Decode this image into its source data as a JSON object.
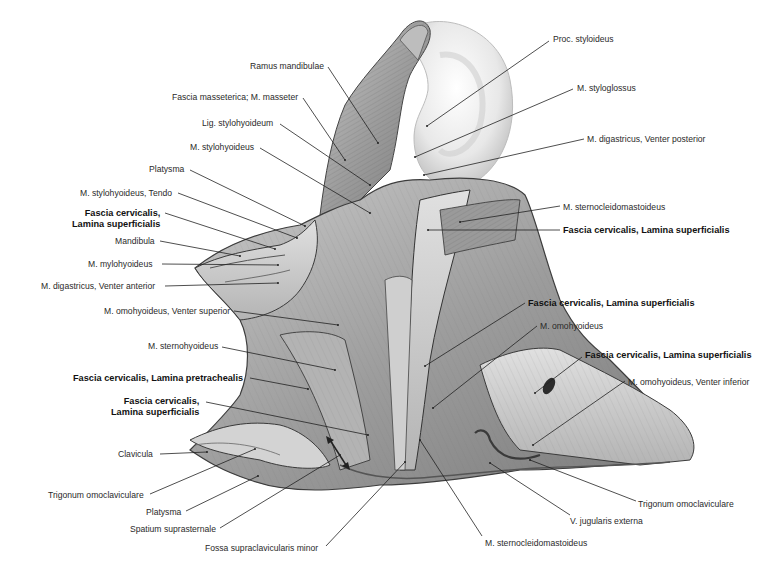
{
  "figure": {
    "colors": {
      "background": "#ffffff",
      "tissue_light": "#d8d8d8",
      "tissue_mid": "#a9a9a9",
      "tissue_dark": "#6e6e6e",
      "ear": "#ececec",
      "line": "#222222",
      "text": "#2a2a2a"
    }
  },
  "labels": [
    {
      "id": "ramus-mandibulae",
      "text": "Ramus mandibulae",
      "bold": false,
      "x": 250,
      "y": 61,
      "align": "left",
      "lx1": 328,
      "ly1": 67,
      "lx2": 378,
      "ly2": 143
    },
    {
      "id": "fascia-masseterica",
      "text": "Fascia masseterica; M. masseter",
      "bold": false,
      "x": 172,
      "y": 92,
      "align": "left",
      "lx1": 303,
      "ly1": 98,
      "lx2": 345,
      "ly2": 160
    },
    {
      "id": "lig-stylohyoideum",
      "text": "Lig. stylohyoideum",
      "bold": false,
      "x": 202,
      "y": 118,
      "align": "left",
      "lx1": 280,
      "ly1": 124,
      "lx2": 370,
      "ly2": 185
    },
    {
      "id": "m-stylohyoideus",
      "text": "M. stylohyoideus",
      "bold": false,
      "x": 190,
      "y": 142,
      "align": "left",
      "lx1": 260,
      "ly1": 148,
      "lx2": 370,
      "ly2": 213
    },
    {
      "id": "platysma-top",
      "text": "Platysma",
      "bold": false,
      "x": 149,
      "y": 164,
      "align": "left",
      "lx1": 190,
      "ly1": 170,
      "lx2": 305,
      "ly2": 226
    },
    {
      "id": "m-stylohyoideus-tendo",
      "text": "M. stylohyoideus, Tendo",
      "bold": false,
      "x": 80,
      "y": 188,
      "align": "left",
      "lx1": 178,
      "ly1": 193,
      "lx2": 297,
      "ly2": 238
    },
    {
      "id": "fascia-cervicalis-left-1",
      "text": "Fascia cervicalis,",
      "text2": "Lamina superficialis",
      "bold": true,
      "x": 72,
      "y": 208,
      "align": "right",
      "lx1": 165,
      "ly1": 213,
      "lx2": 275,
      "ly2": 249
    },
    {
      "id": "mandibula",
      "text": "Mandibula",
      "bold": false,
      "x": 115,
      "y": 236,
      "align": "left",
      "lx1": 160,
      "ly1": 241,
      "lx2": 240,
      "ly2": 256
    },
    {
      "id": "m-mylohyoideus",
      "text": "M. mylohyoideus",
      "bold": false,
      "x": 88,
      "y": 259,
      "align": "left",
      "lx1": 162,
      "ly1": 264,
      "lx2": 278,
      "ly2": 265
    },
    {
      "id": "m-digastricus-anterior",
      "text": "M. digastricus, Venter anterior",
      "bold": false,
      "x": 41,
      "y": 281,
      "align": "left",
      "lx1": 165,
      "ly1": 286,
      "lx2": 278,
      "ly2": 283
    },
    {
      "id": "m-omohyoideus-superior",
      "text": "M. omohyoideus, Venter superior",
      "bold": false,
      "x": 104,
      "y": 306,
      "align": "left",
      "lx1": 234,
      "ly1": 311,
      "lx2": 338,
      "ly2": 325
    },
    {
      "id": "m-sternohyoideus",
      "text": "M. sternohyoideus",
      "bold": false,
      "x": 148,
      "y": 341,
      "align": "left",
      "lx1": 222,
      "ly1": 347,
      "lx2": 335,
      "ly2": 370
    },
    {
      "id": "fascia-pretrachealis",
      "text": "Fascia cervicalis, Lamina pretrachealis",
      "bold": true,
      "x": 73,
      "y": 373,
      "align": "left",
      "lx1": 250,
      "ly1": 378,
      "lx2": 308,
      "ly2": 389
    },
    {
      "id": "fascia-cervicalis-left-2",
      "text": "Fascia cervicalis,",
      "text2": "Lamina superficialis",
      "bold": true,
      "x": 111,
      "y": 396,
      "align": "right",
      "lx1": 206,
      "ly1": 402,
      "lx2": 368,
      "ly2": 435
    },
    {
      "id": "clavicula",
      "text": "Clavicula",
      "bold": false,
      "x": 118,
      "y": 449,
      "align": "left",
      "lx1": 160,
      "ly1": 454,
      "lx2": 207,
      "ly2": 452
    },
    {
      "id": "trigonum-omoclaviculare-left",
      "text": "Trigonum omoclaviculare",
      "bold": false,
      "x": 48,
      "y": 490,
      "align": "left",
      "lx1": 150,
      "ly1": 494,
      "lx2": 255,
      "ly2": 449
    },
    {
      "id": "platysma-bottom",
      "text": "Platysma",
      "bold": false,
      "x": 146,
      "y": 507,
      "align": "left",
      "lx1": 186,
      "ly1": 511,
      "lx2": 258,
      "ly2": 476
    },
    {
      "id": "spatium-suprasternale",
      "text": "Spatium suprasternale",
      "bold": false,
      "x": 130,
      "y": 524,
      "align": "left",
      "lx1": 220,
      "ly1": 528,
      "lx2": 340,
      "ly2": 455
    },
    {
      "id": "fossa-supraclavicularis-minor",
      "text": "Fossa supraclavicularis minor",
      "bold": false,
      "x": 205,
      "y": 543,
      "align": "left",
      "lx1": 326,
      "ly1": 546,
      "lx2": 405,
      "ly2": 462
    },
    {
      "id": "m-sternocleidomastoideus-bottom",
      "text": "M. sternocleidomastoideus",
      "bold": false,
      "x": 485,
      "y": 538,
      "align": "left",
      "lx1": 482,
      "ly1": 536,
      "lx2": 420,
      "ly2": 440
    },
    {
      "id": "v-jugularis-externa",
      "text": "V. jugularis externa",
      "bold": false,
      "x": 570,
      "y": 516,
      "align": "left",
      "lx1": 570,
      "ly1": 515,
      "lx2": 490,
      "ly2": 463
    },
    {
      "id": "trigonum-omoclaviculare-right",
      "text": "Trigonum omoclaviculare",
      "bold": false,
      "x": 638,
      "y": 499,
      "align": "left",
      "lx1": 636,
      "ly1": 501,
      "lx2": 530,
      "ly2": 460
    },
    {
      "id": "m-omohyoideus-inferior",
      "text": "M. omohyoideus, Venter inferior",
      "bold": false,
      "x": 628,
      "y": 377,
      "align": "left",
      "lx1": 625,
      "ly1": 381,
      "lx2": 533,
      "ly2": 445
    },
    {
      "id": "fascia-cervicalis-right-3",
      "text": "Fascia cervicalis, Lamina superficialis",
      "bold": true,
      "x": 585,
      "y": 350,
      "align": "left",
      "lx1": 582,
      "ly1": 357,
      "lx2": 535,
      "ly2": 393
    },
    {
      "id": "m-omohyoideus",
      "text": "M. omohyoideus",
      "bold": false,
      "x": 540,
      "y": 321,
      "align": "left",
      "lx1": 537,
      "ly1": 326,
      "lx2": 433,
      "ly2": 408
    },
    {
      "id": "fascia-cervicalis-right-2",
      "text": "Fascia cervicalis, Lamina superficialis",
      "bold": true,
      "x": 528,
      "y": 298,
      "align": "left",
      "lx1": 525,
      "ly1": 303,
      "lx2": 425,
      "ly2": 366
    },
    {
      "id": "fascia-cervicalis-right-1",
      "text": "Fascia cervicalis, Lamina superficialis",
      "bold": true,
      "x": 563,
      "y": 225,
      "align": "left",
      "lx1": 560,
      "ly1": 230,
      "lx2": 428,
      "ly2": 230
    },
    {
      "id": "m-sternocleidomastoideus-top",
      "text": "M. sternocleidomastoideus",
      "bold": false,
      "x": 563,
      "y": 202,
      "align": "left",
      "lx1": 560,
      "ly1": 206,
      "lx2": 460,
      "ly2": 222
    },
    {
      "id": "m-digastricus-posterior",
      "text": "M. digastricus, Venter posterior",
      "bold": false,
      "x": 587,
      "y": 134,
      "align": "left",
      "lx1": 584,
      "ly1": 139,
      "lx2": 424,
      "ly2": 175
    },
    {
      "id": "m-styloglossus",
      "text": "M. styloglossus",
      "bold": false,
      "x": 577,
      "y": 83,
      "align": "left",
      "lx1": 573,
      "ly1": 89,
      "lx2": 415,
      "ly2": 157
    },
    {
      "id": "proc-styloideus",
      "text": "Proc. styloideus",
      "bold": false,
      "x": 553,
      "y": 34,
      "align": "left",
      "lx1": 549,
      "ly1": 41,
      "lx2": 427,
      "ly2": 126
    }
  ]
}
